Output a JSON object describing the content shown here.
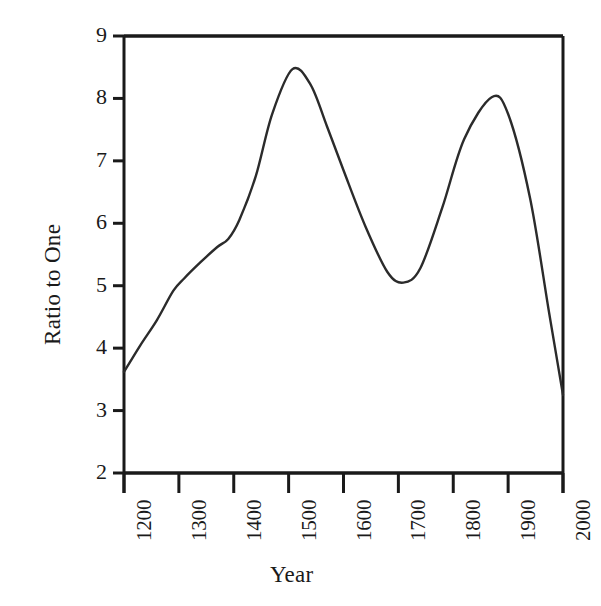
{
  "chart_data": {
    "type": "line",
    "title": "",
    "subtitle": "",
    "xlabel": "Year",
    "ylabel": "Ratio to One",
    "xlim": [
      1200,
      2000
    ],
    "ylim": [
      2,
      9
    ],
    "xticks": [
      1200,
      1300,
      1400,
      1500,
      1600,
      1700,
      1800,
      1900,
      2000
    ],
    "xtick_labels": [
      "1200",
      "1300",
      "1400",
      "1500",
      "1600",
      "1700",
      "1800",
      "1900",
      "2000"
    ],
    "yticks": [
      2,
      3,
      4,
      5,
      6,
      7,
      8,
      9
    ],
    "ytick_labels": [
      "2",
      "3",
      "4",
      "5",
      "6",
      "7",
      "8",
      "9"
    ],
    "grid": false,
    "legend": null,
    "legend_position": "none",
    "line_color": "#2b2b2b",
    "line_width": 2.4,
    "background_color": "#ffffff",
    "axis_color": "#1a1a1a",
    "series": [
      {
        "name": "Ratio to One",
        "x": [
          1200,
          1230,
          1260,
          1290,
          1310,
          1340,
          1370,
          1390,
          1410,
          1440,
          1470,
          1507,
          1540,
          1570,
          1600,
          1640,
          1680,
          1709,
          1740,
          1780,
          1820,
          1870,
          1900,
          1940,
          1975,
          2000
        ],
        "y": [
          3.62,
          4.05,
          4.45,
          4.92,
          5.12,
          5.38,
          5.62,
          5.75,
          6.05,
          6.75,
          7.75,
          8.47,
          8.22,
          7.55,
          6.85,
          5.95,
          5.22,
          5.05,
          5.28,
          6.25,
          7.35,
          8.02,
          7.75,
          6.4,
          4.55,
          3.25
        ]
      }
    ],
    "annotations": []
  },
  "axes": {
    "spines": {
      "top": true,
      "right": true,
      "bottom": true,
      "left": true
    },
    "tick_direction": "out"
  }
}
